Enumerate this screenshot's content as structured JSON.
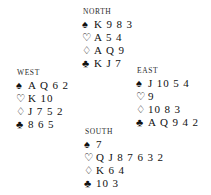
{
  "diagram": {
    "background_color": "#ffffff",
    "text_color": "#111111"
  },
  "suits": {
    "spade": {
      "name": "spade-symbol",
      "glyph": "♠"
    },
    "heart": {
      "name": "heart-symbol",
      "glyph": "♡"
    },
    "diamond": {
      "name": "diamond-symbol",
      "glyph": "♢"
    },
    "club": {
      "name": "club-symbol",
      "glyph": "♣"
    }
  },
  "hands": {
    "north": {
      "label": "NORTH",
      "spades": "K 9 8 3",
      "hearts": "A 5 4",
      "diamonds": "A Q 9",
      "clubs": "K J 7"
    },
    "west": {
      "label": "WEST",
      "spades": "A Q 6 2",
      "hearts": "K 10",
      "diamonds": "J 7 5 2",
      "clubs": "8 6 5"
    },
    "east": {
      "label": "EAST",
      "spades": "J 10 5 4",
      "hearts": "9",
      "diamonds": "10 8 3",
      "clubs": "A Q 9 4 2"
    },
    "south": {
      "label": "SOUTH",
      "spades": "7",
      "hearts": "Q J 8 7 6 3 2",
      "diamonds": "K 6 4",
      "clubs": "10 3"
    }
  }
}
